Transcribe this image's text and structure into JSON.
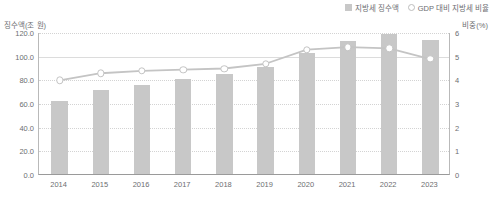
{
  "legend": {
    "items": [
      {
        "label": "지방세 징수액",
        "marker": "bar-swatch",
        "color": "#c8c8c8"
      },
      {
        "label": "GDP 대비 지방세 비율",
        "marker": "circle-outline",
        "color": "#c4c4c4"
      }
    ]
  },
  "axes": {
    "left_title": "징수액(조 원)",
    "right_title": "비중(%)",
    "left_ticks": [
      "0.0",
      "20.0",
      "40.0",
      "60.0",
      "80.0",
      "100.0",
      "120.0"
    ],
    "right_ticks": [
      "0",
      "1",
      "2",
      "3",
      "4",
      "5",
      "6"
    ]
  },
  "chart_data": {
    "type": "bar",
    "title": "",
    "subtitle": "",
    "xlabel": "",
    "ylabel": "징수액(조 원)",
    "y2label": "비중(%)",
    "categories": [
      "2014",
      "2015",
      "2016",
      "2017",
      "2018",
      "2019",
      "2020",
      "2021",
      "2022",
      "2023"
    ],
    "series": [
      {
        "name": "지방세 징수액",
        "type": "bar",
        "axis": "left",
        "unit": "조 원",
        "color": "#c8c8c8",
        "values": [
          61.7,
          71.0,
          75.5,
          80.4,
          84.3,
          90.5,
          102.0,
          112.5,
          118.0,
          113.4
        ]
      },
      {
        "name": "GDP 대비 지방세 비율",
        "type": "line",
        "axis": "right",
        "unit": "%",
        "color": "#c4c4c4",
        "marker": "circle-outline",
        "values": [
          4.0,
          4.3,
          4.4,
          4.45,
          4.5,
          4.7,
          5.3,
          5.4,
          5.35,
          4.9
        ]
      }
    ],
    "ylim": [
      0,
      120
    ],
    "y2lim": [
      0,
      6
    ],
    "grid": true,
    "legend_position": "top-right"
  }
}
